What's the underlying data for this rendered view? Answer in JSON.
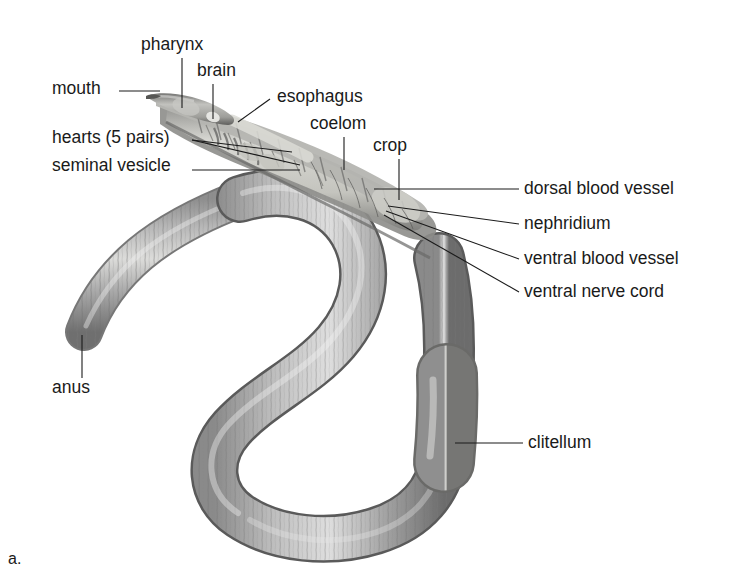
{
  "figure": {
    "caption": "a.",
    "background_color": "#ffffff",
    "ink_color": "#1a1a1a",
    "body_gray_light": "#c9c9c9",
    "body_gray_mid": "#9a9a9a",
    "body_gray_dark": "#6b6b6b",
    "organ_gray": "#d8d8d4"
  },
  "labels": [
    {
      "id": "mouth",
      "text": "mouth",
      "x": 52,
      "y": 86,
      "align": "left"
    },
    {
      "id": "pharynx",
      "text": "pharynx",
      "x": 141,
      "y": 42,
      "align": "left"
    },
    {
      "id": "brain",
      "text": "brain",
      "x": 197,
      "y": 68,
      "align": "left"
    },
    {
      "id": "esophagus",
      "text": "esophagus",
      "x": 277,
      "y": 94,
      "align": "left"
    },
    {
      "id": "hearts",
      "text": "hearts (5 pairs)",
      "x": 52,
      "y": 135,
      "align": "left"
    },
    {
      "id": "coelom",
      "text": "coelom",
      "x": 310,
      "y": 121,
      "align": "left"
    },
    {
      "id": "crop",
      "text": "crop",
      "x": 373,
      "y": 143,
      "align": "left"
    },
    {
      "id": "seminal-vesicle",
      "text": "seminal vesicle",
      "x": 52,
      "y": 163,
      "align": "left"
    },
    {
      "id": "dorsal-blood-vessel",
      "text": "dorsal blood vessel",
      "x": 524,
      "y": 183,
      "align": "left"
    },
    {
      "id": "nephridium",
      "text": "nephridium",
      "x": 524,
      "y": 219,
      "align": "left"
    },
    {
      "id": "ventral-blood-vessel",
      "text": "ventral blood vessel",
      "x": 524,
      "y": 254,
      "align": "left"
    },
    {
      "id": "ventral-nerve-cord",
      "text": "ventral nerve cord",
      "x": 524,
      "y": 287,
      "align": "left"
    },
    {
      "id": "anus",
      "text": "anus",
      "x": 52,
      "y": 385,
      "align": "left"
    },
    {
      "id": "clitellum",
      "text": "clitellum",
      "x": 528,
      "y": 437,
      "align": "left"
    }
  ]
}
